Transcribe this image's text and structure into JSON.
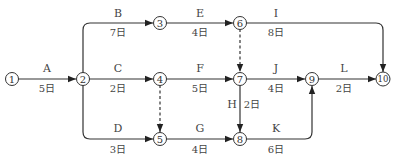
{
  "diagram": {
    "type": "activity-on-arrow network",
    "nodes": [
      {
        "id": "1",
        "label": "1"
      },
      {
        "id": "2",
        "label": "2"
      },
      {
        "id": "3",
        "label": "3"
      },
      {
        "id": "4",
        "label": "4"
      },
      {
        "id": "5",
        "label": "5"
      },
      {
        "id": "6",
        "label": "6"
      },
      {
        "id": "7",
        "label": "7"
      },
      {
        "id": "8",
        "label": "8"
      },
      {
        "id": "9",
        "label": "9"
      },
      {
        "id": "10",
        "label": "10"
      }
    ],
    "activities": [
      {
        "name": "A",
        "from": "1",
        "to": "2",
        "duration": "5日"
      },
      {
        "name": "B",
        "from": "2",
        "to": "3",
        "duration": "7日"
      },
      {
        "name": "C",
        "from": "2",
        "to": "4",
        "duration": "2日"
      },
      {
        "name": "D",
        "from": "2",
        "to": "5",
        "duration": "3日"
      },
      {
        "name": "E",
        "from": "3",
        "to": "6",
        "duration": "4日"
      },
      {
        "name": "F",
        "from": "4",
        "to": "7",
        "duration": "5日"
      },
      {
        "name": "G",
        "from": "5",
        "to": "8",
        "duration": "4日"
      },
      {
        "name": "H",
        "from": "7",
        "to": "8",
        "duration": "2日"
      },
      {
        "name": "I",
        "from": "6",
        "to": "10",
        "duration": "8日"
      },
      {
        "name": "J",
        "from": "7",
        "to": "9",
        "duration": "4日"
      },
      {
        "name": "K",
        "from": "8",
        "to": "9",
        "duration": "6日"
      },
      {
        "name": "L",
        "from": "9",
        "to": "10",
        "duration": "2日"
      }
    ],
    "dummy_activities": [
      {
        "from": "6",
        "to": "7"
      },
      {
        "from": "4",
        "to": "5"
      }
    ]
  }
}
